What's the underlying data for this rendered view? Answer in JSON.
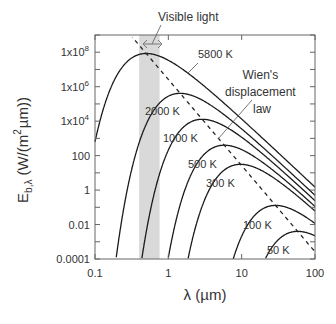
{
  "chart_data": {
    "type": "line",
    "title": "",
    "xlabel": "λ (µm)",
    "ylabel": "E_b,λ (W/(m² µm))",
    "ylabel_parts": {
      "main": "E",
      "sub": "b,λ",
      "unit_pre": "(W/(m",
      "unit_sup": "2",
      "unit_post": "µm))"
    },
    "xscale": "log",
    "yscale": "log",
    "xlim": [
      0.1,
      100
    ],
    "ylim": [
      0.0001,
      1000000000.0
    ],
    "x_ticks": [
      {
        "value": 0.1,
        "label": "0.1"
      },
      {
        "value": 1,
        "label": "1"
      },
      {
        "value": 10,
        "label": "10"
      },
      {
        "value": 100,
        "label": "100"
      }
    ],
    "y_ticks": [
      {
        "value": 100000000.0,
        "label": "1x10",
        "exp": "8"
      },
      {
        "value": 1000000.0,
        "label": "1x10",
        "exp": "6"
      },
      {
        "value": 10000.0,
        "label": "1x10",
        "exp": "4"
      },
      {
        "value": 100,
        "label": "100",
        "exp": ""
      },
      {
        "value": 1,
        "label": "1",
        "exp": ""
      },
      {
        "value": 0.01,
        "label": "0.01",
        "exp": ""
      },
      {
        "value": 0.0001,
        "label": "0.0001",
        "exp": ""
      }
    ],
    "grid": false,
    "legend": "none (inline curve labels)",
    "series": [
      {
        "name": "5800 K",
        "temperature_K": 5800,
        "peak_um": 0.5,
        "peak_value": 85000000.0,
        "label_pos": [
          198,
          58
        ]
      },
      {
        "name": "2000 K",
        "temperature_K": 2000,
        "peak_um": 1.45,
        "peak_value": 1000000.0,
        "label_pos": [
          145,
          115
        ]
      },
      {
        "name": "1000 K",
        "temperature_K": 1000,
        "peak_um": 2.9,
        "peak_value": 32000.0,
        "label_pos": [
          163,
          142
        ]
      },
      {
        "name": "500 K",
        "temperature_K": 500,
        "peak_um": 5.8,
        "peak_value": 1000.0,
        "label_pos": [
          188,
          168
        ]
      },
      {
        "name": "300 K",
        "temperature_K": 300,
        "peak_um": 9.7,
        "peak_value": 130.0,
        "label_pos": [
          206,
          187
        ]
      },
      {
        "name": "100 K",
        "temperature_K": 100,
        "peak_um": 29,
        "peak_value": 0.53,
        "label_pos": [
          243,
          229
        ]
      },
      {
        "name": "50 K",
        "temperature_K": 50,
        "peak_um": 58,
        "peak_value": 0.017,
        "label_pos": [
          267,
          254
        ]
      }
    ],
    "wien_line": {
      "name": "Wien's displacement law",
      "constant_um_K": 2898,
      "style": "dashed"
    },
    "annotations": [
      {
        "text": "Visible light",
        "range_um": [
          0.4,
          0.76
        ],
        "shaded": true,
        "color": "#d9d9d9"
      },
      {
        "text_lines": [
          "Wien's",
          "displacement",
          "law"
        ]
      }
    ],
    "colors": {
      "curve": "#1a1a1a",
      "axis": "#555555",
      "band": "#d9d9d9",
      "text": "#333333"
    }
  }
}
